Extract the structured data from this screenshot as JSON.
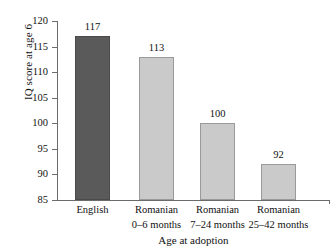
{
  "chart_data": {
    "type": "bar",
    "title": "",
    "xlabel": "Age at adoption",
    "ylabel": "IQ score at age 6",
    "ylim": [
      85,
      120
    ],
    "yticks": [
      85,
      90,
      95,
      100,
      105,
      110,
      115,
      120
    ],
    "grid": false,
    "legend": null,
    "categories": [
      "English",
      "Romanian",
      "Romanian",
      "Romanian"
    ],
    "category_sublabels": [
      "",
      "0–6 months",
      "7–24 months",
      "25–42 months"
    ],
    "values": [
      117,
      113,
      100,
      92
    ],
    "value_labels": [
      "117",
      "113",
      "100",
      "92"
    ],
    "bar_colors": [
      "#5a5a5a",
      "#cacaca",
      "#cacaca",
      "#cacaca"
    ],
    "bar_edge_colors": [
      "#4a4a4a",
      "#9a9a9a",
      "#9a9a9a",
      "#9a9a9a"
    ]
  },
  "axes": {
    "y_title": "IQ score at age 6",
    "x_title": "Age at adoption",
    "y_tick_labels": [
      "120",
      "115",
      "110",
      "105",
      "100",
      "95",
      "90",
      "85"
    ]
  },
  "colors": {
    "background": "#ffffff",
    "axis": "#6b6b6b",
    "text": "#111111",
    "bar_dark": "#5a5a5a",
    "bar_light": "#cacaca"
  }
}
